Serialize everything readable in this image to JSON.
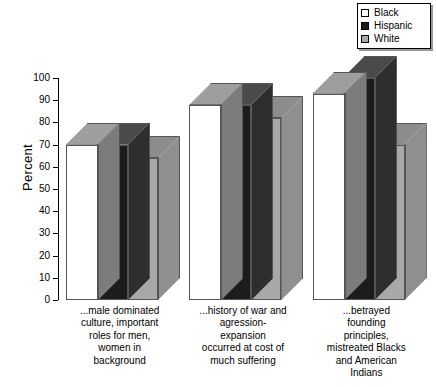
{
  "chart_data": {
    "type": "bar",
    "title": "",
    "subtitle": "",
    "xlabel": "",
    "ylabel": "Percent",
    "ylim": [
      0,
      100
    ],
    "ytick_labels": [
      "0",
      "10",
      "20",
      "30",
      "40",
      "50",
      "60",
      "70",
      "80",
      "90",
      "100"
    ],
    "ytick_values": [
      0,
      10,
      20,
      30,
      40,
      50,
      60,
      70,
      80,
      90,
      100
    ],
    "grid": false,
    "three_d": true,
    "legend_position": "top-right",
    "categories": [
      "...male dominated culture, important roles for men, women in background",
      "...history of war and agression-expansion occurred at cost of much suffering",
      "...betrayed founding principles, mistreated Blacks and American Indians"
    ],
    "category_lines": [
      [
        "...male dominated",
        "culture, important",
        "roles for men,",
        "women in",
        "background"
      ],
      [
        "...history of war and",
        "agression-",
        "expansion",
        "occurred at cost of",
        "much suffering"
      ],
      [
        "...betrayed",
        "founding",
        "principles,",
        "mistreated Blacks",
        "and American",
        "Indians"
      ]
    ],
    "series": [
      {
        "name": "Black",
        "color": "#ffffff",
        "values": [
          70,
          88,
          93
        ]
      },
      {
        "name": "Hispanic",
        "color": "#1c1c1c",
        "values": [
          70,
          88,
          100
        ]
      },
      {
        "name": "White",
        "color": "#a8a8a8",
        "values": [
          64,
          82,
          70
        ]
      }
    ]
  },
  "legend": {
    "items": [
      {
        "label": "Black",
        "swatch": "legend-swatch-black"
      },
      {
        "label": "Hispanic",
        "swatch": "legend-swatch-hispanic"
      },
      {
        "label": "White",
        "swatch": "legend-swatch-white"
      }
    ]
  },
  "axis": {
    "y_title": "Percent"
  }
}
